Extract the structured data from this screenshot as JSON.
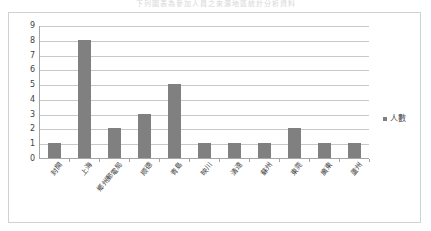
{
  "top_clipped_text": "下列圖表為參加人員之來源地區統計分析資料",
  "legend": {
    "marker_color": "#808080",
    "label": "人數"
  },
  "colors": {
    "bar": "#808080",
    "gridline": "#c8c8c8",
    "axis": "#a6a6a6",
    "frame": "#d2d2d2",
    "text": "#3f3f3f",
    "background": "#ffffff"
  },
  "chart_data": {
    "type": "bar",
    "title": "",
    "xlabel": "",
    "ylabel": "",
    "ylim": [
      0,
      9
    ],
    "yticks": [
      0,
      1,
      2,
      3,
      4,
      5,
      6,
      7,
      8,
      9
    ],
    "grid": true,
    "legend_position": "right",
    "categories": [
      "封開",
      "上海",
      "鄉州郵電局",
      "顺德",
      "青島",
      "映川",
      "清遠",
      "蘇州",
      "東莞",
      "廣東",
      "蘆州"
    ],
    "series": [
      {
        "name": "人數",
        "values": [
          1,
          8,
          2,
          3,
          5,
          1,
          1,
          1,
          2,
          1,
          1
        ]
      }
    ]
  }
}
